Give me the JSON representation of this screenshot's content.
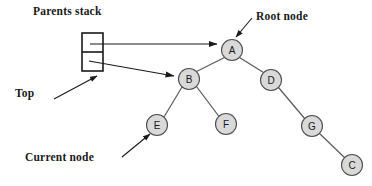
{
  "diagram": {
    "title_labels": {
      "parents_stack": "Parents stack",
      "top": "Top",
      "root_node": "Root node",
      "current_node": "Current node"
    },
    "stack": {
      "name": "parents-stack",
      "cells": [
        {
          "id": "stack-cell-top",
          "value": ""
        },
        {
          "id": "stack-cell-second",
          "value": ""
        }
      ]
    },
    "nodes": [
      {
        "id": "node-a",
        "label": "A",
        "cx": 232,
        "cy": 50,
        "r": 10.5
      },
      {
        "id": "node-b",
        "label": "B",
        "cx": 189,
        "cy": 79,
        "r": 10.5
      },
      {
        "id": "node-d",
        "label": "D",
        "cx": 271,
        "cy": 80,
        "r": 10.5
      },
      {
        "id": "node-e",
        "label": "E",
        "cx": 157,
        "cy": 125,
        "r": 10.5
      },
      {
        "id": "node-f",
        "label": "F",
        "cx": 226,
        "cy": 124,
        "r": 10.5
      },
      {
        "id": "node-g",
        "label": "G",
        "cx": 312,
        "cy": 126,
        "r": 10.5
      },
      {
        "id": "node-c",
        "label": "C",
        "cx": 352,
        "cy": 165,
        "r": 10.5
      }
    ],
    "edges": [
      {
        "id": "edge-a-b",
        "from": "A",
        "to": "B"
      },
      {
        "id": "edge-a-d",
        "from": "A",
        "to": "D"
      },
      {
        "id": "edge-b-e",
        "from": "B",
        "to": "E"
      },
      {
        "id": "edge-b-f",
        "from": "B",
        "to": "F"
      },
      {
        "id": "edge-d-g",
        "from": "D",
        "to": "G"
      },
      {
        "id": "edge-g-c",
        "from": "G",
        "to": "C"
      }
    ],
    "pointers": [
      {
        "id": "pointer-stack-top-to-a",
        "from": "stack-cell-top",
        "to": "node-a"
      },
      {
        "id": "pointer-stack-second-to-b",
        "from": "stack-cell-second",
        "to": "node-b"
      },
      {
        "id": "pointer-top-label",
        "from": "Top",
        "to": "stack-cell-second"
      },
      {
        "id": "pointer-root-node-label",
        "from": "Root node",
        "to": "node-a"
      },
      {
        "id": "pointer-current-node-label",
        "from": "Current node",
        "to": "node-e"
      }
    ],
    "colors": {
      "node_fill": "#d9d9d9",
      "node_stroke": "#4d4d4d",
      "edge": "#595959",
      "arrow": "#1a1a1a",
      "text": "#1a1a1a",
      "background": "#ffffff"
    }
  }
}
